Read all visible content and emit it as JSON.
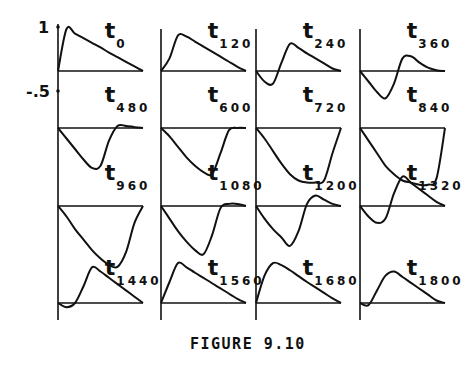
{
  "caption": "FIGURE 9.10",
  "y_axis": {
    "top_label": "1",
    "mid_label": "-.5"
  },
  "chart_data": {
    "type": "line",
    "title": "FIGURE 9.10",
    "xlabel": "",
    "ylabel": "",
    "y_ticks": [
      1,
      -0.5
    ],
    "grid": false,
    "legend": null,
    "panels": [
      {
        "label": "t",
        "subscript": "0",
        "row": 0,
        "col": 0,
        "shape": "positive triangular pulse, sharp rise to 1, linear decay"
      },
      {
        "label": "t",
        "subscript": "120",
        "row": 0,
        "col": 1,
        "shape": "positive pulse, rise then linear decay"
      },
      {
        "label": "t",
        "subscript": "240",
        "row": 0,
        "col": 2,
        "shape": "small negative dip then positive peak, decay"
      },
      {
        "label": "t",
        "subscript": "360",
        "row": 0,
        "col": 3,
        "shape": "larger negative dip then small positive peak"
      },
      {
        "label": "t",
        "subscript": "480",
        "row": 1,
        "col": 0,
        "shape": "deep negative trough, small positive overshoot"
      },
      {
        "label": "t",
        "subscript": "600",
        "row": 1,
        "col": 1,
        "shape": "deep negative trough returning to zero"
      },
      {
        "label": "t",
        "subscript": "720",
        "row": 1,
        "col": 2,
        "shape": "broad flat-bottomed negative trough"
      },
      {
        "label": "t",
        "subscript": "840",
        "row": 1,
        "col": 3,
        "shape": "broad flat-bottomed negative trough, steep right edge"
      },
      {
        "label": "t",
        "subscript": "960",
        "row": 2,
        "col": 0,
        "shape": "negative trough, steep right recovery"
      },
      {
        "label": "t",
        "subscript": "1080",
        "row": 2,
        "col": 1,
        "shape": "negative trough, small positive bump at end"
      },
      {
        "label": "t",
        "subscript": "1200",
        "row": 2,
        "col": 2,
        "shape": "negative trough then positive peak"
      },
      {
        "label": "t",
        "subscript": "1320",
        "row": 2,
        "col": 3,
        "shape": "small negative dip then tall positive peak"
      },
      {
        "label": "t",
        "subscript": "1440",
        "row": 3,
        "col": 0,
        "shape": "slight negative dip then positive peak, linear decay"
      },
      {
        "label": "t",
        "subscript": "1560",
        "row": 3,
        "col": 1,
        "shape": "positive triangular pulse, linear decay"
      },
      {
        "label": "t",
        "subscript": "1680",
        "row": 3,
        "col": 2,
        "shape": "positive rounded pulse, linear decay"
      },
      {
        "label": "t",
        "subscript": "1800",
        "row": 3,
        "col": 3,
        "shape": "slight negative dip then positive peak, decay"
      }
    ],
    "x": [
      0,
      0.1,
      0.2,
      0.3,
      0.4,
      0.5,
      0.6,
      0.7,
      0.8,
      0.9,
      1.0
    ],
    "series": [
      {
        "name": "t0",
        "values": [
          0,
          1.0,
          0.89,
          0.78,
          0.67,
          0.56,
          0.44,
          0.33,
          0.22,
          0.11,
          0
        ]
      },
      {
        "name": "t120",
        "values": [
          0,
          0.3,
          0.85,
          0.82,
          0.7,
          0.58,
          0.46,
          0.34,
          0.22,
          0.1,
          0
        ]
      },
      {
        "name": "t240",
        "values": [
          0,
          -0.25,
          -0.3,
          0.2,
          0.65,
          0.55,
          0.42,
          0.3,
          0.18,
          0.06,
          0
        ]
      },
      {
        "name": "t360",
        "values": [
          0,
          -0.25,
          -0.5,
          -0.65,
          -0.3,
          0.3,
          0.35,
          0.2,
          0.08,
          0.02,
          0
        ]
      },
      {
        "name": "t480",
        "values": [
          0,
          -0.25,
          -0.5,
          -0.75,
          -0.95,
          -0.9,
          -0.3,
          0.05,
          0.05,
          0.02,
          0
        ]
      },
      {
        "name": "t600",
        "values": [
          0,
          -0.2,
          -0.45,
          -0.7,
          -0.9,
          -1.05,
          -1.1,
          -0.6,
          -0.05,
          0,
          0
        ]
      },
      {
        "name": "t720",
        "values": [
          0,
          -0.25,
          -0.55,
          -0.85,
          -1.1,
          -1.25,
          -1.3,
          -1.3,
          -1.25,
          -0.6,
          0
        ]
      },
      {
        "name": "t840",
        "values": [
          0,
          -0.3,
          -0.6,
          -0.9,
          -1.1,
          -1.25,
          -1.3,
          -1.35,
          -1.35,
          -1.2,
          0
        ]
      },
      {
        "name": "t960",
        "values": [
          0,
          -0.25,
          -0.55,
          -0.8,
          -1.05,
          -1.25,
          -1.4,
          -1.45,
          -1.1,
          -0.4,
          0
        ]
      },
      {
        "name": "t1080",
        "values": [
          0,
          -0.3,
          -0.6,
          -0.85,
          -1.05,
          -1.15,
          -0.7,
          -0.05,
          0.05,
          0.05,
          0
        ]
      },
      {
        "name": "t1200",
        "values": [
          0,
          -0.3,
          -0.55,
          -0.75,
          -0.95,
          -0.6,
          0.05,
          0.25,
          0.15,
          0.05,
          0
        ]
      },
      {
        "name": "t1320",
        "values": [
          0,
          -0.25,
          -0.4,
          -0.3,
          0.3,
          0.7,
          0.55,
          0.4,
          0.25,
          0.1,
          0
        ]
      },
      {
        "name": "t1440",
        "values": [
          0,
          -0.1,
          0.0,
          0.4,
          0.85,
          0.75,
          0.6,
          0.45,
          0.3,
          0.15,
          0
        ]
      },
      {
        "name": "t1560",
        "values": [
          0,
          0.5,
          0.95,
          0.85,
          0.72,
          0.6,
          0.47,
          0.35,
          0.22,
          0.1,
          0
        ]
      },
      {
        "name": "t1680",
        "values": [
          0,
          0.65,
          0.95,
          0.9,
          0.78,
          0.64,
          0.5,
          0.37,
          0.24,
          0.11,
          0
        ]
      },
      {
        "name": "t1800",
        "values": [
          0,
          -0.05,
          0.3,
          0.65,
          0.75,
          0.62,
          0.48,
          0.34,
          0.2,
          0.06,
          0
        ]
      }
    ]
  }
}
